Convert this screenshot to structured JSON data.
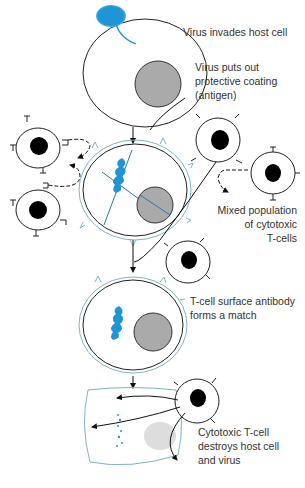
{
  "diagram": {
    "type": "process-flow",
    "colors": {
      "virus_blue": "#1e96d6",
      "membrane_blue": "#7bb4cc",
      "nucleus_gray": "#aaaaaa",
      "tcell_nucleus": "#000000",
      "line": "#111111",
      "text": "#333333"
    },
    "steps": [
      {
        "id": "step-1",
        "label": "Virus invades host cell"
      },
      {
        "id": "step-2",
        "label_lines": [
          "Virus puts out",
          "protective coating",
          "(antigen)"
        ]
      },
      {
        "id": "step-3",
        "label_lines": [
          "Mixed population",
          "of cytotoxic",
          "T-cells"
        ]
      },
      {
        "id": "step-4",
        "label_lines": [
          "T-cell surface antibody",
          "forms a match"
        ]
      },
      {
        "id": "step-5",
        "label_lines": [
          "Cytotoxic T-cell",
          "destroys host cell",
          "and virus"
        ]
      }
    ]
  }
}
